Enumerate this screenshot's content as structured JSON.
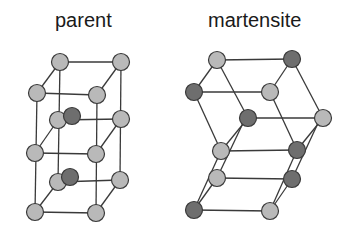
{
  "titles": {
    "parent": "parent",
    "martensite": "martensite"
  },
  "colors": {
    "light_atom": "#b9b9b9",
    "dark_atom": "#6e6e6e",
    "bond": "#3a3a3a",
    "text": "#1a1a1a"
  },
  "diagram": {
    "parent": {
      "description": "tetragonal parent lattice: two stacked cubes with light atoms at corners and dark interstitial atoms",
      "atoms": [
        {
          "id": "p1",
          "x": 60,
          "y": 62,
          "type": "light"
        },
        {
          "id": "p2",
          "x": 121,
          "y": 62,
          "type": "light"
        },
        {
          "id": "p3",
          "x": 37,
          "y": 93,
          "type": "light"
        },
        {
          "id": "p4",
          "x": 97,
          "y": 95,
          "type": "light"
        },
        {
          "id": "p5",
          "x": 58,
          "y": 120,
          "type": "light"
        },
        {
          "id": "p6",
          "x": 121,
          "y": 119,
          "type": "light"
        },
        {
          "id": "p7",
          "x": 35,
          "y": 153,
          "type": "light"
        },
        {
          "id": "p8",
          "x": 96,
          "y": 154,
          "type": "light"
        },
        {
          "id": "p9",
          "x": 58,
          "y": 182,
          "type": "light"
        },
        {
          "id": "p10",
          "x": 120,
          "y": 180,
          "type": "light"
        },
        {
          "id": "p11",
          "x": 35,
          "y": 212,
          "type": "light"
        },
        {
          "id": "p12",
          "x": 96,
          "y": 213,
          "type": "light"
        },
        {
          "id": "pd1",
          "x": 72,
          "y": 116,
          "type": "dark"
        },
        {
          "id": "pd2",
          "x": 70,
          "y": 177,
          "type": "dark"
        }
      ]
    },
    "martensite": {
      "description": "sheared martensite lattice with alternating light and dark atoms",
      "atoms": [
        {
          "id": "m1",
          "x": 217,
          "y": 60,
          "type": "light"
        },
        {
          "id": "m2",
          "x": 292,
          "y": 59,
          "type": "dark"
        },
        {
          "id": "m3",
          "x": 194,
          "y": 92,
          "type": "dark"
        },
        {
          "id": "m4",
          "x": 270,
          "y": 92,
          "type": "light"
        },
        {
          "id": "m5",
          "x": 248,
          "y": 118,
          "type": "dark"
        },
        {
          "id": "m6",
          "x": 323,
          "y": 118,
          "type": "light"
        },
        {
          "id": "m7",
          "x": 221,
          "y": 151,
          "type": "light"
        },
        {
          "id": "m8",
          "x": 297,
          "y": 150,
          "type": "dark"
        },
        {
          "id": "m9",
          "x": 217,
          "y": 178,
          "type": "light"
        },
        {
          "id": "m10",
          "x": 292,
          "y": 179,
          "type": "dark"
        },
        {
          "id": "m11",
          "x": 194,
          "y": 210,
          "type": "dark"
        },
        {
          "id": "m12",
          "x": 270,
          "y": 211,
          "type": "light"
        }
      ]
    }
  }
}
